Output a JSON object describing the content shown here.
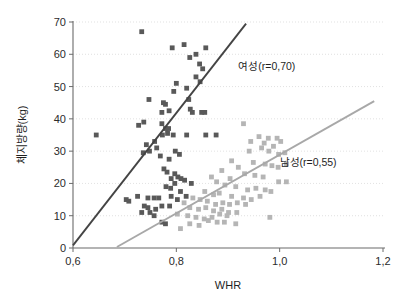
{
  "chart_data": {
    "type": "scatter",
    "title": "",
    "xlabel": "WHR",
    "ylabel": "체지방량(kg)",
    "xlim": [
      0.6,
      1.2
    ],
    "ylim": [
      0,
      70
    ],
    "xticks": [
      0.6,
      0.8,
      1.0,
      1.2
    ],
    "xtick_labels": [
      "0,6",
      "0,8",
      "1,0",
      "1,2"
    ],
    "yticks": [
      0,
      10,
      20,
      30,
      40,
      50,
      60,
      70
    ],
    "ytick_labels": [
      "0",
      "10",
      "20",
      "30",
      "40",
      "50",
      "60",
      "70"
    ],
    "grid": true,
    "grid_axis": "y",
    "legend_position": "inline-annotation",
    "series": [
      {
        "name": "여성(r=0,70)",
        "label": "여성(r=0,70)",
        "correlation": 0.7,
        "color": "#595959",
        "marker": "square",
        "marker_size": 2.4,
        "label_x": 0.975,
        "label_y": 55.0,
        "trendline": {
          "x0": 0.6,
          "y0": 0.8,
          "x1": 0.935,
          "y1": 69.5,
          "color": "#444444",
          "width": 1.9
        },
        "points": [
          [
            0.733,
            67.0
          ],
          [
            0.792,
            62.0
          ],
          [
            0.815,
            63.0
          ],
          [
            0.826,
            59.0
          ],
          [
            0.838,
            60.0
          ],
          [
            0.857,
            62.0
          ],
          [
            0.845,
            57.0
          ],
          [
            0.851,
            55.5
          ],
          [
            0.8,
            51.0
          ],
          [
            0.846,
            51.5
          ],
          [
            0.838,
            53.0
          ],
          [
            0.795,
            48.5
          ],
          [
            0.82,
            49.5
          ],
          [
            0.824,
            46.0
          ],
          [
            0.747,
            46.0
          ],
          [
            0.779,
            44.5
          ],
          [
            0.775,
            45.0
          ],
          [
            0.786,
            42.5
          ],
          [
            0.772,
            42.0
          ],
          [
            0.827,
            43.0
          ],
          [
            0.831,
            42.0
          ],
          [
            0.849,
            42.0
          ],
          [
            0.855,
            42.0
          ],
          [
            0.737,
            39.0
          ],
          [
            0.727,
            38.0
          ],
          [
            0.772,
            38.5
          ],
          [
            0.779,
            37.0
          ],
          [
            0.785,
            37.0
          ],
          [
            0.783,
            35.5
          ],
          [
            0.794,
            35.0
          ],
          [
            0.773,
            35.0
          ],
          [
            0.645,
            35.0
          ],
          [
            0.82,
            35.0
          ],
          [
            0.857,
            35.0
          ],
          [
            0.877,
            35.0
          ],
          [
            0.758,
            33.0
          ],
          [
            0.742,
            32.0
          ],
          [
            0.762,
            31.0
          ],
          [
            0.748,
            30.0
          ],
          [
            0.736,
            29.5
          ],
          [
            0.798,
            30.0
          ],
          [
            0.806,
            29.0
          ],
          [
            0.769,
            28.5
          ],
          [
            0.786,
            27.5
          ],
          [
            0.776,
            24.5
          ],
          [
            0.782,
            23.5
          ],
          [
            0.797,
            23.0
          ],
          [
            0.803,
            22.0
          ],
          [
            0.809,
            21.5
          ],
          [
            0.79,
            21.5
          ],
          [
            0.797,
            20.0
          ],
          [
            0.816,
            21.0
          ],
          [
            0.829,
            20.0
          ],
          [
            0.78,
            19.0
          ],
          [
            0.789,
            18.5
          ],
          [
            0.808,
            17.5
          ],
          [
            0.819,
            16.0
          ],
          [
            0.79,
            16.0
          ],
          [
            0.802,
            15.0
          ],
          [
            0.725,
            16.0
          ],
          [
            0.703,
            15.0
          ],
          [
            0.708,
            14.5
          ],
          [
            0.745,
            15.5
          ],
          [
            0.757,
            15.5
          ],
          [
            0.766,
            15.5
          ],
          [
            0.738,
            13.0
          ],
          [
            0.745,
            12.5
          ],
          [
            0.76,
            12.0
          ],
          [
            0.772,
            13.0
          ],
          [
            0.787,
            13.0
          ],
          [
            0.733,
            11.0
          ],
          [
            0.749,
            11.0
          ],
          [
            0.757,
            10.0
          ],
          [
            0.772,
            8.0
          ],
          [
            0.779,
            7.5
          ]
        ]
      },
      {
        "name": "남성(r=0,55)",
        "label": "남성(r=0,55)",
        "correlation": 0.55,
        "color": "#b5b5b5",
        "marker": "square",
        "marker_size": 2.4,
        "label_x": 1.055,
        "label_y": 25.5,
        "trendline": {
          "x0": 0.685,
          "y0": 0.3,
          "x1": 1.183,
          "y1": 45.5,
          "color": "#a8a8a8",
          "width": 1.9
        },
        "points": [
          [
            0.93,
            38.5
          ],
          [
            0.96,
            34.5
          ],
          [
            0.978,
            34.0
          ],
          [
            0.995,
            34.0
          ],
          [
            1.002,
            33.0
          ],
          [
            0.944,
            33.0
          ],
          [
            0.97,
            32.5
          ],
          [
            0.988,
            31.5
          ],
          [
            0.965,
            31.0
          ],
          [
            0.979,
            30.0
          ],
          [
            0.941,
            30.0
          ],
          [
            0.998,
            29.0
          ],
          [
            1.01,
            29.5
          ],
          [
            0.907,
            27.0
          ],
          [
            0.949,
            26.5
          ],
          [
            0.972,
            26.0
          ],
          [
            0.985,
            25.5
          ],
          [
            0.997,
            25.0
          ],
          [
            1.013,
            26.0
          ],
          [
            0.92,
            25.0
          ],
          [
            0.888,
            24.0
          ],
          [
            0.932,
            23.0
          ],
          [
            0.952,
            22.5
          ],
          [
            0.968,
            22.0
          ],
          [
            0.998,
            20.5
          ],
          [
            1.013,
            20.5
          ],
          [
            0.868,
            22.0
          ],
          [
            0.904,
            21.5
          ],
          [
            0.878,
            20.5
          ],
          [
            0.894,
            19.5
          ],
          [
            0.915,
            19.0
          ],
          [
            0.938,
            18.0
          ],
          [
            0.954,
            18.5
          ],
          [
            0.972,
            18.0
          ],
          [
            0.983,
            17.5
          ],
          [
            0.855,
            17.5
          ],
          [
            0.872,
            16.5
          ],
          [
            0.883,
            17.0
          ],
          [
            0.907,
            16.0
          ],
          [
            0.93,
            15.5
          ],
          [
            0.945,
            15.0
          ],
          [
            0.962,
            16.0
          ],
          [
            0.832,
            15.5
          ],
          [
            0.846,
            15.0
          ],
          [
            0.86,
            14.5
          ],
          [
            0.876,
            13.5
          ],
          [
            0.89,
            14.0
          ],
          [
            0.903,
            13.5
          ],
          [
            0.918,
            14.0
          ],
          [
            0.934,
            13.5
          ],
          [
            0.815,
            14.0
          ],
          [
            0.826,
            12.5
          ],
          [
            0.843,
            12.0
          ],
          [
            0.857,
            12.5
          ],
          [
            0.872,
            11.5
          ],
          [
            0.888,
            12.0
          ],
          [
            0.901,
            11.0
          ],
          [
            0.917,
            11.0
          ],
          [
            0.802,
            10.5
          ],
          [
            0.822,
            10.0
          ],
          [
            0.838,
            9.5
          ],
          [
            0.854,
            9.0
          ],
          [
            0.869,
            9.5
          ],
          [
            0.884,
            10.5
          ],
          [
            0.898,
            10.0
          ],
          [
            0.981,
            9.5
          ],
          [
            0.862,
            8.5
          ],
          [
            0.879,
            8.0
          ],
          [
            0.893,
            8.0
          ],
          [
            0.808,
            6.0
          ],
          [
            0.826,
            7.5
          ],
          [
            0.844,
            7.0
          ],
          [
            0.915,
            7.5
          ]
        ]
      }
    ]
  }
}
